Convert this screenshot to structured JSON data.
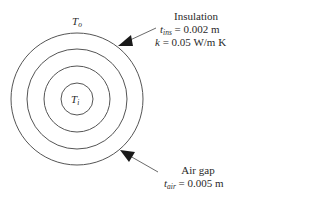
{
  "diagram": {
    "outer_temp": {
      "symbol": "T",
      "subscript": "o"
    },
    "inner_temp": {
      "symbol": "T",
      "subscript": "i"
    },
    "insulation": {
      "title": "Insulation",
      "thickness": {
        "symbol": "t",
        "subscript": "ins",
        "value": "= 0.002 m"
      },
      "conductivity": {
        "symbol": "k",
        "value": "= 0.05 W/m K"
      }
    },
    "air_gap": {
      "title": "Air gap",
      "thickness": {
        "symbol": "t",
        "subscript": "air",
        "value": "= 0.005 m"
      }
    },
    "circles": [
      {
        "name": "outer",
        "r": 66
      },
      {
        "name": "insulation-inner",
        "r": 50
      },
      {
        "name": "air-gap-inner",
        "r": 33
      },
      {
        "name": "core",
        "r": 16
      }
    ],
    "stroke_color": "#555555",
    "arrow_color": "#1a1a1a"
  }
}
